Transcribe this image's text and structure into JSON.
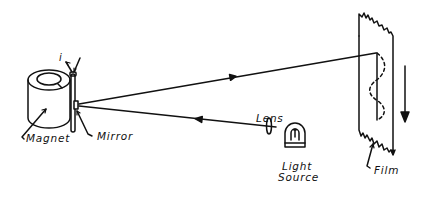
{
  "diagram": {
    "type": "mirror-galvanometer-oscillograph",
    "labels": {
      "current": "i",
      "magnet": "Magnet",
      "mirror": "Mirror",
      "lens": "Lens",
      "light_source_line1": "Light",
      "light_source_line2": "Source",
      "film": "Film"
    },
    "components": [
      {
        "id": "magnet",
        "label": "Magnet"
      },
      {
        "id": "mirror",
        "label": "Mirror"
      },
      {
        "id": "lens",
        "label": "Lens"
      },
      {
        "id": "light-source",
        "label": "Light Source"
      },
      {
        "id": "film",
        "label": "Film"
      }
    ],
    "light_path": [
      {
        "from": "light-source",
        "to": "lens"
      },
      {
        "from": "lens",
        "to": "mirror",
        "arrow": "toward mirror"
      },
      {
        "from": "mirror",
        "to": "film",
        "arrow": "toward film"
      }
    ],
    "film_motion": "downward",
    "trace": "sinusoidal dashed curve on film",
    "colors": {
      "ink": "#111111",
      "background": "#ffffff"
    }
  }
}
